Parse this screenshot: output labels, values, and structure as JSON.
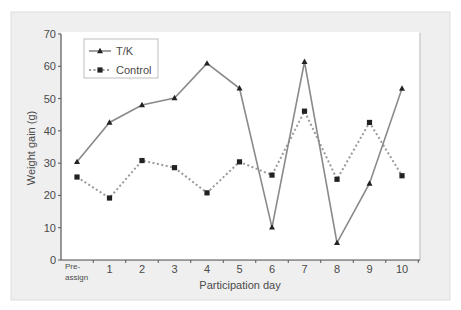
{
  "chart_data": {
    "type": "line",
    "title": "",
    "xlabel": "Participation day",
    "ylabel": "Weight gain (g)",
    "ylim": [
      0,
      70
    ],
    "yticks": [
      0,
      10,
      20,
      30,
      40,
      50,
      60,
      70
    ],
    "categories": [
      "Pre-\nassign",
      "1",
      "2",
      "3",
      "4",
      "5",
      "6",
      "7",
      "8",
      "9",
      "10"
    ],
    "grid": false,
    "legend_position": "upper-left",
    "series": [
      {
        "name": "T/K",
        "style": "solid",
        "marker": "triangle",
        "color": "#8a8a8a",
        "values": [
          30.4,
          42.6,
          48.0,
          50.2,
          60.9,
          53.2,
          10.1,
          61.4,
          5.3,
          23.7,
          53.1
        ]
      },
      {
        "name": "Control",
        "style": "dotted",
        "marker": "square",
        "color": "#9a9a9a",
        "values": [
          25.7,
          19.2,
          30.8,
          28.6,
          20.8,
          30.4,
          26.3,
          46.1,
          25.0,
          42.6,
          26.1
        ]
      }
    ]
  },
  "colors": {
    "frame_bg": "#efefef",
    "plot_bg": "#ffffff",
    "axis": "#555555",
    "marker": "#222222"
  }
}
